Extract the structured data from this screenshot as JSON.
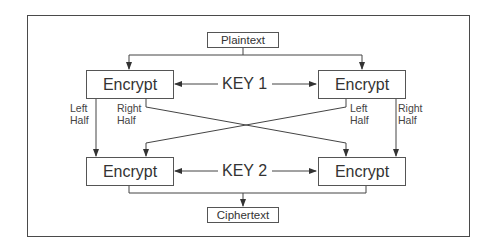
{
  "diagram": {
    "type": "flow",
    "title": "",
    "nodes": {
      "input": {
        "label": "Plaintext"
      },
      "output": {
        "label": "Ciphertext"
      },
      "encrypt_top_left": {
        "label": "Encrypt"
      },
      "encrypt_top_right": {
        "label": "Encrypt"
      },
      "encrypt_bottom_left": {
        "label": "Encrypt"
      },
      "encrypt_bottom_right": {
        "label": "Encrypt"
      }
    },
    "keys": {
      "key1": {
        "label": "KEY 1"
      },
      "key2": {
        "label": "KEY 2"
      }
    },
    "edge_labels": {
      "tl_left": {
        "line1": "Left",
        "line2": "Half"
      },
      "tl_right": {
        "line1": "Right",
        "line2": "Half"
      },
      "tr_left": {
        "line1": "Left",
        "line2": "Half"
      },
      "tr_right": {
        "line1": "Right",
        "line2": "Half"
      }
    },
    "edges": [
      {
        "from": "Plaintext",
        "to": "Encrypt (top-left)"
      },
      {
        "from": "Plaintext",
        "to": "Encrypt (top-right)"
      },
      {
        "from": "KEY 1",
        "to": "Encrypt (top-left)"
      },
      {
        "from": "KEY 1",
        "to": "Encrypt (top-right)"
      },
      {
        "from": "Encrypt (top-left)",
        "to": "Encrypt (bottom-left)",
        "label": "Left Half"
      },
      {
        "from": "Encrypt (top-left)",
        "to": "Encrypt (bottom-right)",
        "label": "Right Half"
      },
      {
        "from": "Encrypt (top-right)",
        "to": "Encrypt (bottom-left)",
        "label": "Left Half"
      },
      {
        "from": "Encrypt (top-right)",
        "to": "Encrypt (bottom-right)",
        "label": "Right Half"
      },
      {
        "from": "KEY 2",
        "to": "Encrypt (bottom-left)"
      },
      {
        "from": "KEY 2",
        "to": "Encrypt (bottom-right)"
      },
      {
        "from": "Encrypt (bottom-left)",
        "to": "Ciphertext"
      },
      {
        "from": "Encrypt (bottom-right)",
        "to": "Ciphertext"
      }
    ],
    "colors": {
      "line": "#444444",
      "border": "#555555",
      "background": "#ffffff"
    }
  }
}
